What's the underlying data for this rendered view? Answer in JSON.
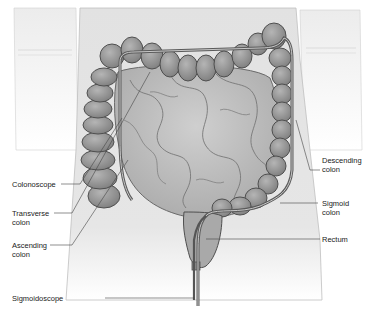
{
  "figure": {
    "style": "grayscale anatomical illustration",
    "colors": {
      "background": "#ffffff",
      "skin": "#e4e4e4",
      "colon": "#9a9a9a",
      "colon_outline": "#555555",
      "intestine": "#bdbdbd",
      "scope": "#6a6a6a",
      "leader_line": "#444444"
    }
  },
  "labels": {
    "colonoscope": "Colonoscope",
    "transverse_colon": "Transverse\ncolon",
    "ascending_colon": "Ascending\ncolon",
    "sigmoidoscope": "Sigmoidoscope",
    "descending_colon": "Descending\ncolon",
    "sigmoid_colon": "Sigmoid\ncolon",
    "rectum": "Rectum"
  }
}
